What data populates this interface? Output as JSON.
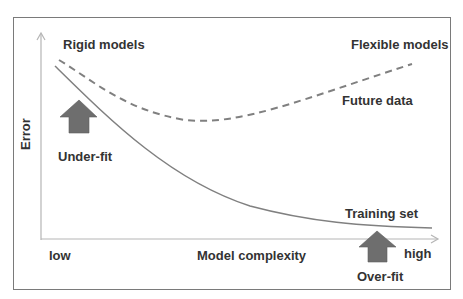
{
  "diagram": {
    "type": "bias-variance tradeoff",
    "y_axis_label": "Error",
    "x_axis_label": "Model complexity",
    "x_axis_low": "low",
    "x_axis_high": "high",
    "region_labels": {
      "left": "Rigid models",
      "right": "Flexible models"
    },
    "curves": [
      {
        "name": "Future data",
        "style": "dashed",
        "color": "#808080",
        "shape": "U-shaped: decreases then increases"
      },
      {
        "name": "Training set",
        "style": "solid",
        "color": "#808080",
        "shape": "monotonically decreasing"
      }
    ],
    "annotations": [
      {
        "label": "Under-fit",
        "marker": "up-arrow",
        "position": "low complexity"
      },
      {
        "label": "Over-fit",
        "marker": "up-arrow",
        "position": "high complexity"
      }
    ],
    "colors": {
      "arrow_fill": "#6e6e6e",
      "curve": "#808080",
      "axis": "#b0b0b0",
      "frame": "#7a7a7a",
      "text": "#333333"
    }
  }
}
